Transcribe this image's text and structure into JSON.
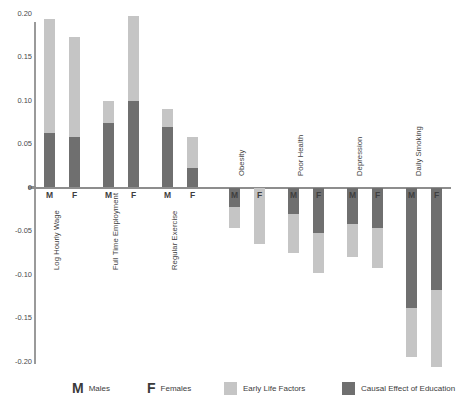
{
  "chart_data": {
    "type": "bar",
    "title": "",
    "subtitle": "",
    "xlabel": "",
    "ylabel": "",
    "ylim": [
      -0.2,
      0.2
    ],
    "yticks": [
      "0.20",
      "0.15",
      "0.10",
      "0.05",
      "0",
      "-0.05",
      "-0.10",
      "-0.15",
      "-0.20"
    ],
    "ytick_values": [
      0.2,
      0.15,
      0.1,
      0.05,
      0,
      -0.05,
      -0.1,
      -0.15,
      -0.2
    ],
    "grid": false,
    "stacked": true,
    "legend_position": "bottom",
    "series": [
      {
        "name": "Early Life Factors",
        "color": "#c5c5c5"
      },
      {
        "name": "Causal Effect of Education",
        "color": "#6f6f6f"
      }
    ],
    "categories": [
      "Log Hourly Wage",
      "Full Time Employment",
      "Regular Exercise",
      "Obesity",
      "Poor Health",
      "Depression",
      "Daily Smoking"
    ],
    "groups": [
      {
        "category": "Log Hourly Wage",
        "bars": [
          {
            "sex": "M",
            "causal_effect_of_education": 0.063,
            "early_life_factors": 0.131,
            "total": 0.194
          },
          {
            "sex": "F",
            "causal_effect_of_education": 0.058,
            "early_life_factors": 0.115,
            "total": 0.173
          }
        ]
      },
      {
        "category": "Full Time Employment",
        "bars": [
          {
            "sex": "M",
            "causal_effect_of_education": 0.074,
            "early_life_factors": 0.025,
            "total": 0.099
          },
          {
            "sex": "F",
            "causal_effect_of_education": 0.099,
            "early_life_factors": 0.098,
            "total": 0.197
          }
        ]
      },
      {
        "category": "Regular Exercise",
        "bars": [
          {
            "sex": "M",
            "causal_effect_of_education": 0.07,
            "early_life_factors": 0.02,
            "total": 0.09
          },
          {
            "sex": "F",
            "causal_effect_of_education": 0.022,
            "early_life_factors": 0.036,
            "total": 0.058
          }
        ]
      },
      {
        "category": "Obesity",
        "bars": [
          {
            "sex": "M",
            "causal_effect_of_education": -0.022,
            "early_life_factors": -0.025,
            "total": -0.047
          },
          {
            "sex": "F",
            "causal_effect_of_education": 0.0,
            "early_life_factors": -0.065,
            "total": -0.065
          }
        ]
      },
      {
        "category": "Poor Health",
        "bars": [
          {
            "sex": "M",
            "causal_effect_of_education": -0.031,
            "early_life_factors": -0.044,
            "total": -0.075
          },
          {
            "sex": "F",
            "causal_effect_of_education": -0.052,
            "early_life_factors": -0.046,
            "total": -0.098
          }
        ]
      },
      {
        "category": "Depression",
        "bars": [
          {
            "sex": "M",
            "causal_effect_of_education": -0.042,
            "early_life_factors": -0.038,
            "total": -0.08
          },
          {
            "sex": "F",
            "causal_effect_of_education": -0.047,
            "early_life_factors": -0.045,
            "total": -0.092
          }
        ]
      },
      {
        "category": "Daily Smoking",
        "bars": [
          {
            "sex": "M",
            "causal_effect_of_education": -0.138,
            "early_life_factors": -0.057,
            "total": -0.195
          },
          {
            "sex": "F",
            "causal_effect_of_education": -0.118,
            "early_life_factors": -0.088,
            "total": -0.206
          }
        ]
      }
    ]
  },
  "axis": {
    "zero_label": "0"
  },
  "legend": {
    "males_glyph": "M",
    "males_label": "Males",
    "females_glyph": "F",
    "females_label": "Females",
    "early_life_label": "Early Life Factors",
    "causal_label": "Causal Effect of Education"
  },
  "colors": {
    "early_life_factors": "#c5c5c5",
    "causal_effect_of_education": "#6f6f6f",
    "axis": "#8d8d8d",
    "text": "#3c3c3c"
  }
}
